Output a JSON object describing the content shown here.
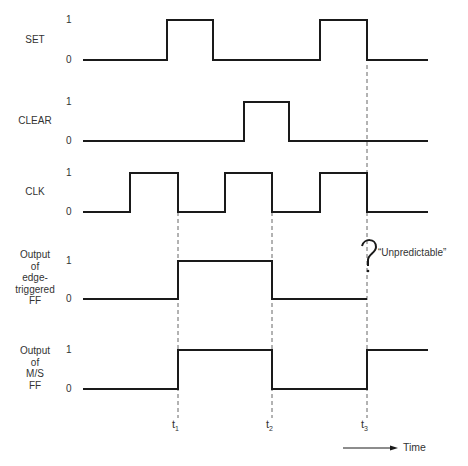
{
  "diagram": {
    "type": "timing-diagram",
    "signals": [
      {
        "name": "SET",
        "label_lines": [
          "SET"
        ],
        "y_high": 20,
        "y_low": 60,
        "high_label": "1",
        "low_label": "0",
        "path": [
          [
            83,
            0
          ],
          [
            167,
            1
          ],
          [
            213,
            0
          ],
          [
            320,
            1
          ],
          [
            367,
            0
          ],
          [
            428,
            0
          ]
        ]
      },
      {
        "name": "CLEAR",
        "label_lines": [
          "CLEAR"
        ],
        "y_high": 102,
        "y_low": 141,
        "high_label": "1",
        "low_label": "0",
        "path": [
          [
            83,
            0
          ],
          [
            244,
            1
          ],
          [
            289,
            0
          ],
          [
            428,
            0
          ]
        ]
      },
      {
        "name": "CLK",
        "label_lines": [
          "CLK"
        ],
        "y_high": 173,
        "y_low": 212,
        "high_label": "1",
        "low_label": "0",
        "path": [
          [
            83,
            0
          ],
          [
            130,
            1
          ],
          [
            178,
            0
          ],
          [
            225,
            1
          ],
          [
            272,
            0
          ],
          [
            320,
            1
          ],
          [
            367,
            0
          ],
          [
            428,
            0
          ]
        ]
      },
      {
        "name": "edge-triggered-output",
        "label_lines": [
          "Output",
          "of",
          "edge-",
          "triggered",
          "FF"
        ],
        "y_high": 261,
        "y_low": 299,
        "high_label": "1",
        "low_label": "0",
        "path": [
          [
            83,
            0
          ],
          [
            178,
            1
          ],
          [
            272,
            0
          ],
          [
            367,
            0
          ]
        ]
      },
      {
        "name": "ms-output",
        "label_lines": [
          "Output",
          "of",
          "M/S",
          "FF"
        ],
        "y_high": 350,
        "y_low": 389,
        "high_label": "1",
        "low_label": "0",
        "path": [
          [
            83,
            0
          ],
          [
            178,
            1
          ],
          [
            272,
            0
          ],
          [
            367,
            1
          ],
          [
            428,
            1
          ]
        ]
      }
    ],
    "time_markers": [
      {
        "x": 178,
        "label": "t",
        "sub": "1",
        "y_top": 212,
        "y_bottom": 418
      },
      {
        "x": 272,
        "label": "t",
        "sub": "2",
        "y_top": 212,
        "y_bottom": 418
      },
      {
        "x": 367,
        "label": "t",
        "sub": "3",
        "y_top": 65,
        "y_bottom": 418
      }
    ],
    "annotation": {
      "text": "“Unpredictable”",
      "symbol": "?"
    },
    "time_axis": {
      "label": "Time"
    }
  }
}
